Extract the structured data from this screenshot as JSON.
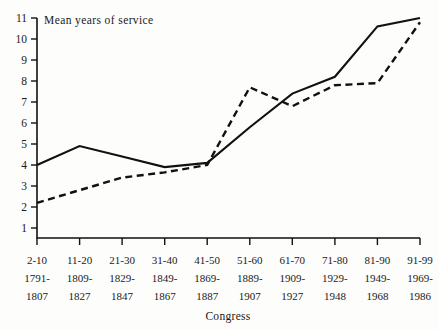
{
  "chart_data": {
    "type": "line",
    "title": "",
    "ylabel": "Mean years of service",
    "xlabel": "Congress",
    "categories": [
      "2-10",
      "11-20",
      "21-30",
      "31-40",
      "41-50",
      "51-60",
      "61-70",
      "71-80",
      "81-90",
      "91-99"
    ],
    "category_sublabels_top": [
      "1791-",
      "1809-",
      "1829-",
      "1849-",
      "1869-",
      "1889-",
      "1909-",
      "1929-",
      "1949-",
      "1969-"
    ],
    "category_sublabels_bottom": [
      "1807",
      "1827",
      "1847",
      "1867",
      "1887",
      "1907",
      "1927",
      "1948",
      "1968",
      "1986"
    ],
    "ylim": [
      0,
      11
    ],
    "yticks": [
      1,
      2,
      3,
      4,
      5,
      6,
      7,
      8,
      9,
      10,
      11
    ],
    "grid": false,
    "legend_position": "none",
    "series": [
      {
        "name": "Senate",
        "style": "solid",
        "color": "#111111",
        "values": [
          4.0,
          4.9,
          4.4,
          3.9,
          4.1,
          5.8,
          7.4,
          8.2,
          10.6,
          11.0
        ]
      },
      {
        "name": "House",
        "style": "dashed",
        "color": "#111111",
        "values": [
          2.2,
          2.8,
          3.4,
          3.65,
          4.0,
          7.7,
          6.8,
          7.8,
          7.9,
          10.8
        ]
      }
    ]
  },
  "axes": {
    "y_axis_caption": "Mean years of service",
    "x_axis_caption": "Congress"
  }
}
